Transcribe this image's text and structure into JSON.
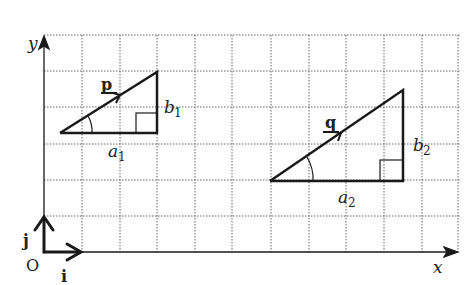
{
  "diagram": {
    "axes": {
      "x_label": "x",
      "y_label": "y",
      "origin_label": "O"
    },
    "unit_vectors": {
      "i_label": "i",
      "j_label": "j"
    },
    "triangle1": {
      "vector_label": "p",
      "horizontal_label": "a",
      "horizontal_sub": "1",
      "vertical_label": "b",
      "vertical_sub": "1"
    },
    "triangle2": {
      "vector_label": "q",
      "horizontal_label": "a",
      "horizontal_sub": "2",
      "vertical_label": "b",
      "vertical_sub": "2"
    },
    "colors": {
      "grid": "#555555",
      "lines": "#1a1a1a",
      "background": "#ffffff"
    }
  }
}
